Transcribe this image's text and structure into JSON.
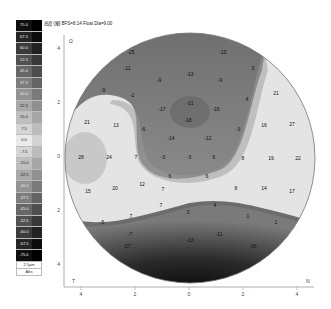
{
  "title": "高度 (图) BFS=8.14 Float Dia=9.00",
  "colorbar": {
    "labels": [
      "75.0",
      "67.5",
      "60.0",
      "52.5",
      "45.0",
      "37.5",
      "30.0",
      "22.5",
      "15.0",
      "7.5",
      "0.0",
      "-7.5",
      "-15.0",
      "-22.5",
      "-30.0",
      "-37.5",
      "-45.0",
      "-52.5",
      "-60.0",
      "-67.5",
      "-75.0"
    ],
    "unit": "2.5µm",
    "mode": "Abs"
  },
  "axes": {
    "left_label": "T",
    "right_label": "N",
    "x_ticks": [
      "4",
      "2",
      "0",
      "2",
      "4"
    ],
    "y_ticks": [
      "4",
      "2",
      "0",
      "2",
      "4"
    ]
  },
  "chart_data": {
    "type": "heatmap",
    "xlabel": "T — N",
    "ylabel": "",
    "xlim": [
      -4.5,
      4.5
    ],
    "ylim": [
      -4.5,
      4.5
    ],
    "scale": {
      "min": -75.0,
      "max": 75.0,
      "step": 7.5,
      "unit": "µm"
    },
    "points": [
      {
        "x": 131,
        "y": 54,
        "v": "-25"
      },
      {
        "x": 223,
        "y": 54,
        "v": "-15"
      },
      {
        "x": 127,
        "y": 70,
        "v": "-11"
      },
      {
        "x": 190,
        "y": 76,
        "v": "-13"
      },
      {
        "x": 159,
        "y": 82,
        "v": "-9"
      },
      {
        "x": 220,
        "y": 82,
        "v": "-9"
      },
      {
        "x": 253,
        "y": 70,
        "v": "3"
      },
      {
        "x": 103,
        "y": 92,
        "v": "-9"
      },
      {
        "x": 132,
        "y": 97,
        "v": "-2"
      },
      {
        "x": 162,
        "y": 111,
        "v": "-17"
      },
      {
        "x": 190,
        "y": 105,
        "v": "-21"
      },
      {
        "x": 216,
        "y": 111,
        "v": "-16"
      },
      {
        "x": 247,
        "y": 101,
        "v": "4"
      },
      {
        "x": 276,
        "y": 95,
        "v": "21"
      },
      {
        "x": 87,
        "y": 124,
        "v": "21"
      },
      {
        "x": 116,
        "y": 127,
        "v": "13"
      },
      {
        "x": 143,
        "y": 131,
        "v": "-6"
      },
      {
        "x": 188,
        "y": 122,
        "v": "-18"
      },
      {
        "x": 171,
        "y": 140,
        "v": "-14"
      },
      {
        "x": 208,
        "y": 140,
        "v": "-12"
      },
      {
        "x": 238,
        "y": 131,
        "v": "-3"
      },
      {
        "x": 264,
        "y": 127,
        "v": "16"
      },
      {
        "x": 292,
        "y": 126,
        "v": "27"
      },
      {
        "x": 81,
        "y": 159,
        "v": "28"
      },
      {
        "x": 109,
        "y": 159,
        "v": "24"
      },
      {
        "x": 136,
        "y": 159,
        "v": "7"
      },
      {
        "x": 163,
        "y": 159,
        "v": "-3"
      },
      {
        "x": 189,
        "y": 159,
        "v": "-3"
      },
      {
        "x": 214,
        "y": 159,
        "v": "6"
      },
      {
        "x": 243,
        "y": 160,
        "v": "8"
      },
      {
        "x": 271,
        "y": 160,
        "v": "19"
      },
      {
        "x": 298,
        "y": 160,
        "v": "22"
      },
      {
        "x": 170,
        "y": 178,
        "v": "6"
      },
      {
        "x": 207,
        "y": 178,
        "v": "6"
      },
      {
        "x": 88,
        "y": 193,
        "v": "15"
      },
      {
        "x": 115,
        "y": 190,
        "v": "20"
      },
      {
        "x": 142,
        "y": 186,
        "v": "12"
      },
      {
        "x": 163,
        "y": 191,
        "v": "7"
      },
      {
        "x": 236,
        "y": 190,
        "v": "8"
      },
      {
        "x": 264,
        "y": 190,
        "v": "14"
      },
      {
        "x": 292,
        "y": 193,
        "v": "17"
      },
      {
        "x": 161,
        "y": 207,
        "v": "7"
      },
      {
        "x": 188,
        "y": 214,
        "v": "3"
      },
      {
        "x": 215,
        "y": 207,
        "v": "4"
      },
      {
        "x": 131,
        "y": 218,
        "v": "7"
      },
      {
        "x": 102,
        "y": 224,
        "v": "-5"
      },
      {
        "x": 248,
        "y": 218,
        "v": "1"
      },
      {
        "x": 276,
        "y": 224,
        "v": "1"
      },
      {
        "x": 130,
        "y": 236,
        "v": "-7"
      },
      {
        "x": 190,
        "y": 242,
        "v": "-13"
      },
      {
        "x": 219,
        "y": 236,
        "v": "-11"
      },
      {
        "x": 127,
        "y": 248,
        "v": "-27"
      },
      {
        "x": 253,
        "y": 248,
        "v": "-26"
      }
    ],
    "grid": false,
    "legend": "left colorbar"
  }
}
